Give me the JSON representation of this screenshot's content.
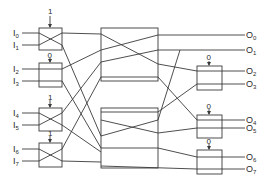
{
  "diagram": {
    "type": "switching-network",
    "inputs": [
      {
        "base": "I",
        "sub": "0"
      },
      {
        "base": "I",
        "sub": "1"
      },
      {
        "base": "I",
        "sub": "2"
      },
      {
        "base": "I",
        "sub": "3"
      },
      {
        "base": "I",
        "sub": "4"
      },
      {
        "base": "I",
        "sub": "5"
      },
      {
        "base": "I",
        "sub": "6"
      },
      {
        "base": "I",
        "sub": "7"
      }
    ],
    "outputs": [
      {
        "base": "O",
        "sub": "0"
      },
      {
        "base": "O",
        "sub": "1"
      },
      {
        "base": "O",
        "sub": "2"
      },
      {
        "base": "O",
        "sub": "3"
      },
      {
        "base": "O",
        "sub": "4"
      },
      {
        "base": "O",
        "sub": "5"
      },
      {
        "base": "O",
        "sub": "6"
      },
      {
        "base": "O",
        "sub": "7"
      }
    ],
    "input_switches": [
      {
        "control": "1",
        "state": "cross"
      },
      {
        "control": "0",
        "state": "straight"
      },
      {
        "control": "1",
        "state": "cross"
      },
      {
        "control": "1",
        "state": "cross"
      }
    ],
    "output_switches": [
      {
        "control": "0",
        "state": "straight"
      },
      {
        "control": "0",
        "state": "straight"
      },
      {
        "control": "0",
        "state": "straight"
      }
    ]
  }
}
